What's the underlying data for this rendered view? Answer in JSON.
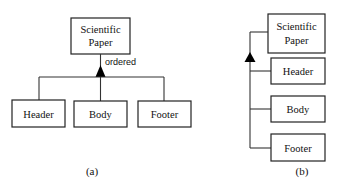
{
  "diagram_a": {
    "caption": "(a)",
    "root": {
      "line1": "Scientific",
      "line2": "Paper"
    },
    "annotation": "ordered",
    "children": [
      {
        "label": "Header"
      },
      {
        "label": "Body"
      },
      {
        "label": "Footer"
      }
    ],
    "relation": "ordered aggregation (filled triangle)"
  },
  "diagram_b": {
    "caption": "(b)",
    "root": {
      "line1": "Scientific",
      "line2": "Paper"
    },
    "children": [
      {
        "label": "Header"
      },
      {
        "label": "Body"
      },
      {
        "label": "Footer"
      }
    ],
    "relation": "ordered aggregation (filled triangle), vertical layout"
  },
  "colors": {
    "stroke": "#222222",
    "triangle": "#000000",
    "background": "#ffffff"
  }
}
